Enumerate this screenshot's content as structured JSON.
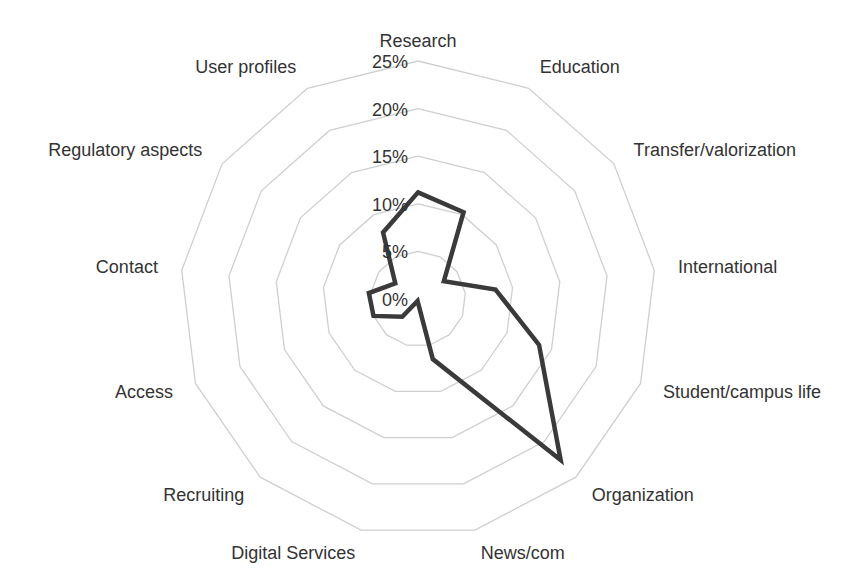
{
  "chart_data": {
    "type": "radar",
    "title": "",
    "categories": [
      "Research",
      "Education",
      "Transfer/valorization",
      "International",
      "Student/campus life",
      "Organization",
      "News/com",
      "Digital Services",
      "Recruiting",
      "Access",
      "Contact",
      "Regulatory aspects",
      "User profiles"
    ],
    "series": [
      {
        "name": "Share",
        "color": "#3a3a3a",
        "values": [
          11.2,
          10.3,
          3.3,
          8.2,
          13.6,
          22.6,
          6.5,
          0.2,
          2.5,
          5.0,
          5.2,
          2.9,
          7.9
        ]
      }
    ],
    "radial_ticks": [
      "0%",
      "5%",
      "10%",
      "15%",
      "20%",
      "25%"
    ],
    "rlim": [
      0,
      25
    ],
    "grid": true,
    "legend": "none"
  },
  "layout": {
    "center": [
      418,
      299
    ],
    "radius": 238,
    "ring_color": "#cfcfcf",
    "label_color": "#333333"
  }
}
